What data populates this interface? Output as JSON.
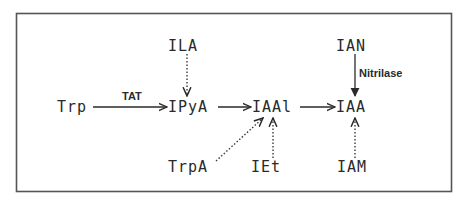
{
  "diagram": {
    "title": "",
    "nodes": {
      "trp": "Trp",
      "ipya": "IPyA",
      "iaal": "IAAl",
      "iaa": "IAA",
      "ila": "ILA",
      "ian": "IAN",
      "trpa": "TrpA",
      "iet": "IEt",
      "iam": "IAM"
    },
    "enzymes": {
      "tat": "TAT",
      "nitrilase": "Nitrilase"
    },
    "edges": [
      {
        "from": "Trp",
        "to": "IPyA",
        "style": "solid",
        "label": "TAT"
      },
      {
        "from": "IPyA",
        "to": "IAAl",
        "style": "solid"
      },
      {
        "from": "IAAl",
        "to": "IAA",
        "style": "solid"
      },
      {
        "from": "ILA",
        "to": "IPyA",
        "style": "dotted"
      },
      {
        "from": "IAN",
        "to": "IAA",
        "style": "solid",
        "label": "Nitrilase"
      },
      {
        "from": "TrpA",
        "to": "IAAl",
        "style": "dotted"
      },
      {
        "from": "IEt",
        "to": "IAAl",
        "style": "dotted"
      },
      {
        "from": "IAM",
        "to": "IAA",
        "style": "dotted"
      }
    ],
    "colors": {
      "ink": "#2a2a2a",
      "frame": "#555555",
      "background": "#ffffff"
    }
  }
}
